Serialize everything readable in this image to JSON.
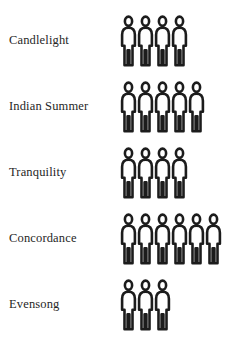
{
  "chart_data": {
    "type": "bar",
    "title": "",
    "subtitle": "",
    "xlabel": "",
    "ylabel": "",
    "grid": false,
    "legend": "none",
    "unit_symbol": "person",
    "unit_value": 1,
    "categories": [
      "Candlelight",
      "Indian Summer",
      "Tranquility",
      "Concordance",
      "Evensong"
    ],
    "values": [
      4,
      5,
      4,
      6,
      3
    ],
    "rows": [
      {
        "label": "Candlelight",
        "value": 4
      },
      {
        "label": "Indian Summer",
        "value": 5
      },
      {
        "label": "Tranquility",
        "value": 4
      },
      {
        "label": "Concordance",
        "value": 6
      },
      {
        "label": "Evensong",
        "value": 3
      }
    ],
    "colors": {
      "background": "#ffffff",
      "icon_stroke": "#1c1c1c",
      "icon_fill": "#ffffff",
      "label_text": "#262626"
    }
  }
}
